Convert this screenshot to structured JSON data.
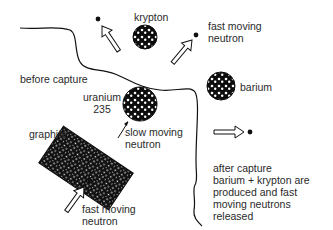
{
  "diagram": {
    "labels": {
      "krypton": "krypton",
      "fast_neutron_top": [
        "fast moving",
        "neutron"
      ],
      "before_capture": "before capture",
      "barium": "barium",
      "uranium": [
        "uranium",
        "235"
      ],
      "slow_neutron": [
        "slow moving",
        "neutron"
      ],
      "graphite": "graphite",
      "fast_neutron_bottom": [
        "fast moving",
        "neutron"
      ],
      "after_capture": [
        "after capture",
        "barium + krypton are",
        "produced and fast",
        "moving neutrons",
        "released"
      ]
    },
    "nodes": [
      {
        "id": "krypton",
        "type": "nucleus"
      },
      {
        "id": "barium",
        "type": "nucleus"
      },
      {
        "id": "uranium-235",
        "type": "nucleus"
      },
      {
        "id": "graphite",
        "type": "moderator-block"
      },
      {
        "id": "neutron-incoming",
        "type": "neutron"
      },
      {
        "id": "neutron-out-1",
        "type": "neutron"
      },
      {
        "id": "neutron-out-2",
        "type": "neutron"
      },
      {
        "id": "neutron-out-3",
        "type": "neutron"
      }
    ],
    "edges": [
      {
        "from": "neutron-incoming",
        "to": "graphite",
        "label": "fast moving neutron"
      },
      {
        "from": "graphite",
        "to": "uranium-235",
        "label": "slow moving neutron"
      },
      {
        "from": "uranium-235",
        "to": "krypton"
      },
      {
        "from": "uranium-235",
        "to": "barium"
      },
      {
        "from": "uranium-235",
        "to": "neutron-out-1"
      },
      {
        "from": "uranium-235",
        "to": "neutron-out-2",
        "label": "fast moving neutron"
      },
      {
        "from": "uranium-235",
        "to": "neutron-out-3"
      }
    ],
    "colors": {
      "ink": "#111111",
      "background": "#ffffff",
      "text": "#2a2a2a"
    }
  }
}
